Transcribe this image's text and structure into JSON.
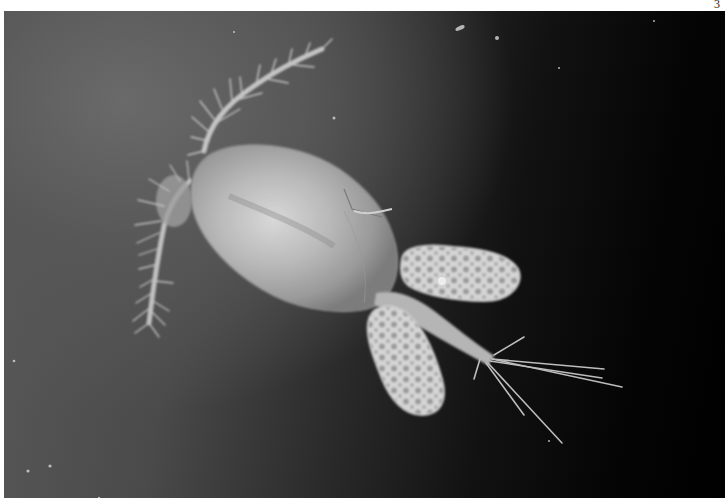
{
  "page": {
    "page_number": "3"
  },
  "photo": {
    "subject": "copepod with two egg sacs",
    "description": "Grayscale micrograph of a female copepod: oval cephalothorax, two long setose antennae at upper left, two clustered egg sacs and a forked caudal furca with long setae at lower right, on a dark gradient background.",
    "colors": {
      "background_light": "#5c5c5c",
      "background_dark": "#0a0a0a",
      "body": "#c8c8c8",
      "egg_sacs": "#d6d6d6",
      "page": "#ffffff"
    }
  }
}
